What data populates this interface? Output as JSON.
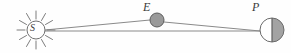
{
  "diagram": {
    "background_color": "#fefefe",
    "stroke_color": "#6b6b6b",
    "line_color": "#8a8a8a",
    "bodies": [
      {
        "id": "sun",
        "label": "S",
        "name": "Sun",
        "icon": "sun-icon",
        "center": {
          "x": 36,
          "y": 30
        },
        "radius": 9,
        "ray_count": 12,
        "ray_length": 9,
        "fill": "#ffffff",
        "outline": "#707070"
      },
      {
        "id": "earth",
        "label": "E",
        "name": "Earth",
        "icon": "filled-circle-icon",
        "center": {
          "x": 157,
          "y": 20
        },
        "radius": 7,
        "fill": "#9a9a9a",
        "outline": "#5d5d5d"
      },
      {
        "id": "planet",
        "label": "P",
        "name": "Planet",
        "icon": "half-shaded-circle-icon",
        "center": {
          "x": 272,
          "y": 30
        },
        "radius": 12,
        "lit_side": "left",
        "lit_fill": "#ffffff",
        "shadow_fill": "#a3a3a3",
        "outline": "#6b6b6b",
        "terminator": "vertical"
      }
    ],
    "sight_lines": [
      {
        "id": "sun-earth-planet",
        "name": "sun-to-earth-to-planet-line",
        "points": [
          {
            "x": 45,
            "y": 30
          },
          {
            "x": 150,
            "y": 20
          },
          {
            "x": 164,
            "y": 22
          },
          {
            "x": 260,
            "y": 31
          }
        ]
      },
      {
        "id": "sun-planet",
        "name": "sun-to-planet-line",
        "points": [
          {
            "x": 45,
            "y": 31
          },
          {
            "x": 260,
            "y": 31
          }
        ]
      }
    ]
  }
}
